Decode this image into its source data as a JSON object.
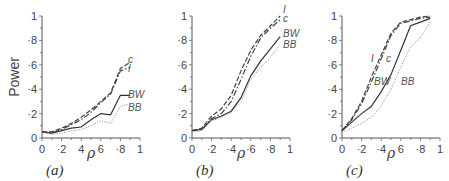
{
  "ylabel": "Power",
  "xlabel": "ρ",
  "chart_data": [
    {
      "type": "line",
      "panel": "(a)",
      "xlabel": "ρ",
      "ylabel": "Power",
      "xlim": [
        0,
        1
      ],
      "ylim": [
        0,
        1
      ],
      "xticks": [
        "0",
        "·2",
        "4",
        "6",
        "·8",
        "1"
      ],
      "yticks": [
        "0",
        "·2",
        "·4",
        "·6",
        "·8",
        "1"
      ],
      "x": [
        0,
        0.1,
        0.2,
        0.3,
        0.4,
        0.5,
        0.6,
        0.7,
        0.8,
        0.9
      ],
      "series": [
        {
          "name": "c",
          "style": "dashed",
          "values": [
            0.05,
            0.05,
            0.08,
            0.12,
            0.17,
            0.23,
            0.3,
            0.37,
            0.57,
            0.62
          ]
        },
        {
          "name": "I",
          "style": "dashdot",
          "values": [
            0.05,
            0.04,
            0.07,
            0.11,
            0.15,
            0.21,
            0.29,
            0.36,
            0.55,
            0.58
          ]
        },
        {
          "name": "BW",
          "style": "solid",
          "values": [
            0.05,
            0.04,
            0.06,
            0.08,
            0.09,
            0.15,
            0.2,
            0.19,
            0.35,
            0.35
          ]
        },
        {
          "name": "BB",
          "style": "dotted",
          "values": [
            0.05,
            0.03,
            0.04,
            0.06,
            0.07,
            0.1,
            0.14,
            0.12,
            0.26,
            0.28
          ]
        }
      ]
    },
    {
      "type": "line",
      "panel": "(b)",
      "xlabel": "ρ",
      "ylabel": "",
      "xlim": [
        0,
        1
      ],
      "ylim": [
        0,
        1
      ],
      "xticks": [
        "0",
        "·2",
        "·4",
        "·6",
        "·8",
        "1"
      ],
      "yticks": [
        "0",
        "·2",
        "·4",
        "·6",
        "·8",
        "1"
      ],
      "x": [
        0,
        0.1,
        0.2,
        0.3,
        0.4,
        0.5,
        0.6,
        0.7,
        0.8,
        0.9
      ],
      "series": [
        {
          "name": "I",
          "style": "dashed",
          "values": [
            0.06,
            0.08,
            0.18,
            0.24,
            0.35,
            0.55,
            0.72,
            0.84,
            0.92,
            1.0
          ]
        },
        {
          "name": "c",
          "style": "dashdot",
          "values": [
            0.06,
            0.07,
            0.16,
            0.2,
            0.3,
            0.48,
            0.67,
            0.82,
            0.9,
            0.97
          ]
        },
        {
          "name": "BW",
          "style": "solid",
          "values": [
            0.06,
            0.07,
            0.15,
            0.18,
            0.22,
            0.33,
            0.51,
            0.63,
            0.73,
            0.83
          ]
        },
        {
          "name": "BB",
          "style": "dotted",
          "values": [
            0.05,
            0.06,
            0.14,
            0.17,
            0.21,
            0.3,
            0.48,
            0.58,
            0.66,
            0.77
          ]
        }
      ]
    },
    {
      "type": "line",
      "panel": "(c)",
      "xlabel": "ρ",
      "ylabel": "",
      "xlim": [
        0,
        1
      ],
      "ylim": [
        0,
        1
      ],
      "xticks": [
        "0",
        "·2",
        "·4",
        "6",
        "·8",
        "1"
      ],
      "yticks": [
        "0",
        "·2",
        "·4",
        "·6",
        "·8",
        "1"
      ],
      "x": [
        0,
        0.1,
        0.2,
        0.3,
        0.4,
        0.5,
        0.6,
        0.7,
        0.8,
        0.9
      ],
      "series": [
        {
          "name": "I",
          "style": "dashed",
          "values": [
            0.06,
            0.16,
            0.3,
            0.5,
            0.68,
            0.86,
            0.95,
            0.97,
            0.99,
            1.0
          ]
        },
        {
          "name": "c",
          "style": "dashdot",
          "values": [
            0.06,
            0.15,
            0.28,
            0.46,
            0.65,
            0.84,
            0.94,
            0.96,
            0.98,
            0.99
          ]
        },
        {
          "name": "BW",
          "style": "solid",
          "values": [
            0.06,
            0.13,
            0.2,
            0.26,
            0.38,
            0.52,
            0.72,
            0.92,
            0.95,
            0.98
          ]
        },
        {
          "name": "BB",
          "style": "dotted",
          "values": [
            0.05,
            0.08,
            0.12,
            0.17,
            0.26,
            0.4,
            0.58,
            0.75,
            0.82,
            0.95
          ]
        }
      ]
    }
  ],
  "panels": [
    {
      "label": "(a)",
      "x0": 42,
      "labels": [
        {
          "text": "c",
          "x": 128,
          "y": 63
        },
        {
          "text": "I",
          "x": 128,
          "y": 72
        },
        {
          "text": "BW",
          "x": 128,
          "y": 98
        },
        {
          "text": "BB",
          "x": 128,
          "y": 111
        }
      ]
    },
    {
      "label": "(b)",
      "x0": 192,
      "labels": [
        {
          "text": "I",
          "x": 283,
          "y": 13
        },
        {
          "text": "c",
          "x": 283,
          "y": 22
        },
        {
          "text": "BW",
          "x": 283,
          "y": 37
        },
        {
          "text": "BB",
          "x": 283,
          "y": 48
        }
      ]
    },
    {
      "label": "(c)",
      "x0": 342,
      "labels": [
        {
          "text": "I",
          "x": 371,
          "y": 62
        },
        {
          "text": "c",
          "x": 386,
          "y": 62
        },
        {
          "text": "BW",
          "x": 374,
          "y": 85
        },
        {
          "text": "BB",
          "x": 401,
          "y": 85
        }
      ]
    }
  ]
}
